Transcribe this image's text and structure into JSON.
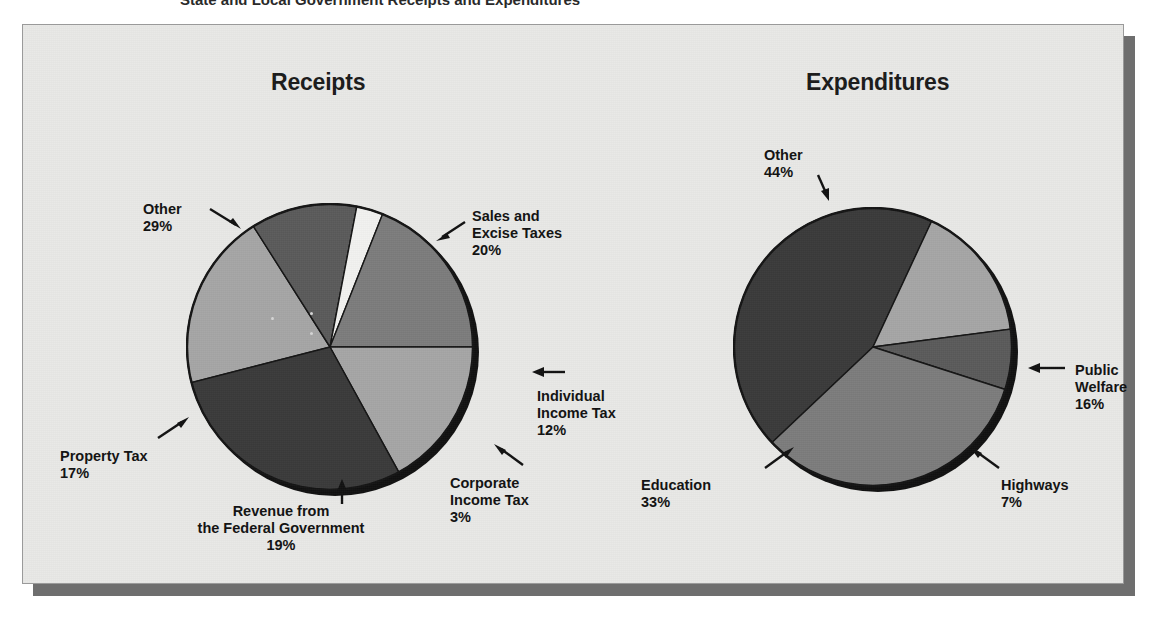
{
  "top_caption": "State and Local Government Receipts and Expenditures",
  "colors": {
    "page_background": "#ffffff",
    "panel_background": "#e9e9e7",
    "panel_border": "#9a9a9a",
    "panel_shadow": "#6e6e6e",
    "pie_shadow": "#101010",
    "slice_dark": "#3a3a3a",
    "slice_medium_dark": "#5a5a5a",
    "slice_medium": "#7c7c7c",
    "slice_light": "#a6a6a6",
    "slice_lighter": "#b5b5b5",
    "slice_white": "#f2f2f0",
    "label_text": "#111111"
  },
  "charts": [
    {
      "id": "receipts",
      "title": "Receipts",
      "labels": {
        "other": {
          "name": "Other",
          "value": "29%"
        },
        "sales": {
          "name": "Sales and",
          "name2": "Excise Taxes",
          "value": "20%"
        },
        "individual": {
          "name": "Individual",
          "name2": "Income Tax",
          "value": "12%"
        },
        "corporate": {
          "name": "Corporate",
          "name2": "Income Tax",
          "value": "3%"
        },
        "revenue": {
          "name": "Revenue from",
          "name2": "the Federal Government",
          "value": "19%"
        },
        "property": {
          "name": "Property Tax",
          "value": "17%"
        }
      }
    },
    {
      "id": "expenditures",
      "title": "Expenditures",
      "labels": {
        "other": {
          "name": "Other",
          "value": "44%"
        },
        "welfare": {
          "name": "Public",
          "name2": "Welfare",
          "value": "16%"
        },
        "highways": {
          "name": "Highways",
          "value": "7%"
        },
        "education": {
          "name": "Education",
          "value": "33%"
        }
      }
    }
  ],
  "chart_data": [
    {
      "type": "pie",
      "title": "Receipts",
      "categories": [
        "Sales and Excise Taxes",
        "Individual Income Tax",
        "Corporate Income Tax",
        "Revenue from the Federal Government",
        "Property Tax",
        "Other"
      ],
      "values": [
        20,
        12,
        3,
        19,
        17,
        29
      ],
      "unit": "percent",
      "labels": [
        "20%",
        "12%",
        "3%",
        "19%",
        "17%",
        "29%"
      ],
      "slice_colors": [
        "#a6a6a6",
        "#5a5a5a",
        "#f2f2f0",
        "#7c7c7c",
        "#a6a6a6",
        "#3a3a3a"
      ],
      "legend": "none",
      "annotations": "leader-line arrows to outside labels",
      "start_angle_deg": -90,
      "direction": "clockwise"
    },
    {
      "type": "pie",
      "title": "Expenditures",
      "categories": [
        "Public Welfare",
        "Highways",
        "Education",
        "Other"
      ],
      "values": [
        16,
        7,
        33,
        44
      ],
      "unit": "percent",
      "labels": [
        "16%",
        "7%",
        "33%",
        "44%"
      ],
      "slice_colors": [
        "#a6a6a6",
        "#5a5a5a",
        "#7c7c7c",
        "#3a3a3a"
      ],
      "legend": "none",
      "annotations": "leader-line arrows to outside labels",
      "start_angle_deg": -90,
      "direction": "clockwise"
    }
  ]
}
